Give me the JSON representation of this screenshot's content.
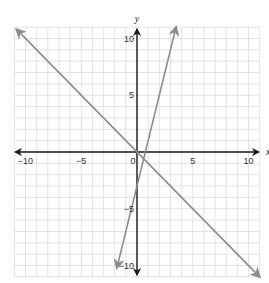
{
  "chart_data": {
    "type": "line",
    "title": "",
    "xlabel": "x",
    "ylabel": "y",
    "xlim": [
      -11,
      11
    ],
    "ylim": [
      -11,
      11
    ],
    "grid": true,
    "x_ticks": [
      -10,
      -5,
      0,
      5,
      10
    ],
    "y_ticks": [
      10,
      5,
      -5,
      -10
    ],
    "tick_labels": {
      "x_neg10": "−10",
      "x_neg5": "−5",
      "origin": "0",
      "x_5": "5",
      "x_10": "10",
      "y_10": "10",
      "y_5": "5",
      "y_neg5": "−5",
      "y_neg10": "−10"
    },
    "series": [
      {
        "name": "line-1",
        "equation": "y = -x",
        "slope": -1,
        "intercept": 0,
        "x": [
          -10.8,
          11
        ],
        "y": [
          10.8,
          -11
        ],
        "color": "#8c8c8c"
      },
      {
        "name": "line-2",
        "equation": "y = 4x - 3",
        "slope": 4,
        "intercept": -3,
        "x": [
          -1.8,
          3.5
        ],
        "y": [
          -10.2,
          11
        ],
        "color": "#8c8c8c"
      }
    ],
    "legend": null
  },
  "colors": {
    "grid": "#dcdcdc",
    "axis": "#1a1a1a",
    "line": "#8c8c8c"
  }
}
